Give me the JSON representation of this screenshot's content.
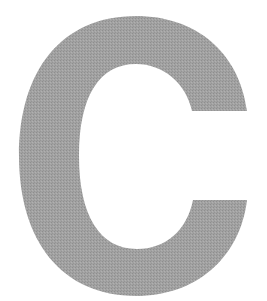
{
  "glyph": {
    "character": "C",
    "fill_color": "#9e9e9e",
    "background_color": "#ffffff"
  }
}
